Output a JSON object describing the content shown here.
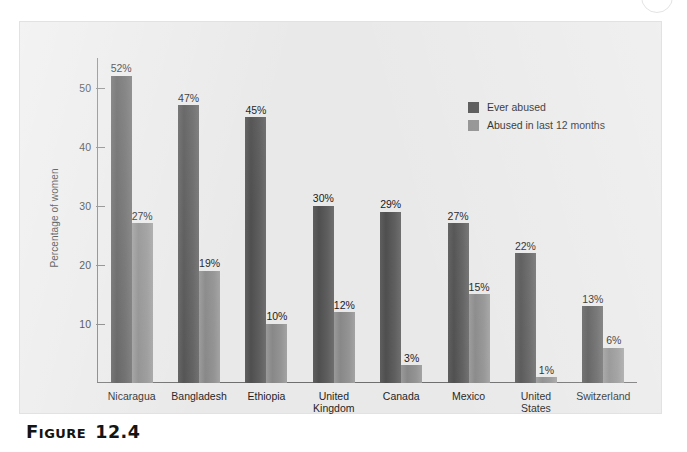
{
  "caption": {
    "word": "Figure",
    "number": "12.4"
  },
  "legend": {
    "position": "top-right-inside",
    "items": [
      {
        "label": "Ever abused",
        "color": "#4f4f4f"
      },
      {
        "label": "Abused in last 12 months",
        "color": "#8d8d8d"
      }
    ]
  },
  "axis": {
    "y_title": "Percentage of women",
    "y_ticks": [
      "10",
      "20",
      "30",
      "40",
      "50"
    ]
  },
  "chart_data": {
    "type": "bar",
    "title": "",
    "subtitle": "",
    "xlabel": "",
    "ylabel": "Percentage of women",
    "ylim": [
      0,
      55
    ],
    "ytick_values": [
      10,
      20,
      30,
      40,
      50
    ],
    "grid": false,
    "legend_position": "upper right",
    "categories": [
      "Nicaragua",
      "Bangladesh",
      "Ethiopia",
      "United Kingdom",
      "Canada",
      "Mexico",
      "United States",
      "Switzerland"
    ],
    "category_display": [
      "Nicaragua",
      "Bangladesh",
      "Ethiopia",
      "United\nKingdom",
      "Canada",
      "Mexico",
      "United\nStates",
      "Switzerland"
    ],
    "series": [
      {
        "name": "Ever abused",
        "color": "#4f4f4f",
        "values": [
          52,
          47,
          45,
          30,
          29,
          27,
          22,
          13
        ],
        "labels": [
          "52%",
          "47%",
          "45%",
          "30%",
          "29%",
          "27%",
          "22%",
          "13%"
        ]
      },
      {
        "name": "Abused in last 12 months",
        "color": "#8d8d8d",
        "values": [
          27,
          19,
          10,
          12,
          3,
          15,
          1,
          6
        ],
        "labels": [
          "27%",
          "19%",
          "10%",
          "12%",
          "3%",
          "15%",
          "1%",
          "6%"
        ]
      }
    ]
  }
}
